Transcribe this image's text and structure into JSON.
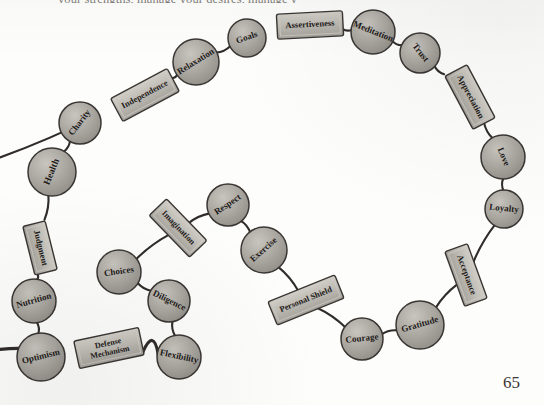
{
  "page": {
    "header_text_sliver": "your strengths, manage your desires, manage y",
    "page_number": "65",
    "background_color": "#fdfdfc",
    "ink_color": "#2f2c29",
    "bead_fill_color": "#a9a6a0",
    "plate_fill_color": "#bfbcb5"
  },
  "diagram": {
    "type": "chain-necklace-concept-map",
    "title": "",
    "nodes": [
      {
        "id": "health",
        "label": "Health",
        "shape": "circle",
        "cx": 52,
        "cy": 172,
        "r": 24,
        "rot": -68,
        "font": 9.5
      },
      {
        "id": "charity",
        "label": "Charity",
        "shape": "circle",
        "cx": 80,
        "cy": 123,
        "r": 21,
        "rot": -52,
        "font": 9.0
      },
      {
        "id": "independence",
        "label": "Independence",
        "shape": "rect",
        "cx": 145,
        "cy": 95,
        "w": 64,
        "h": 26,
        "rot": -28,
        "font": 8.6
      },
      {
        "id": "relaxation",
        "label": "Relaxation",
        "shape": "circle",
        "cx": 196,
        "cy": 62,
        "r": 23,
        "rot": -32,
        "font": 9.0
      },
      {
        "id": "goals",
        "label": "Goals",
        "shape": "circle",
        "cx": 247,
        "cy": 38,
        "r": 19,
        "rot": -20,
        "font": 9.0
      },
      {
        "id": "assertiveness",
        "label": "Assertiveness",
        "shape": "rect",
        "cx": 310,
        "cy": 25,
        "w": 66,
        "h": 25,
        "rot": -3,
        "font": 8.6
      },
      {
        "id": "meditation",
        "label": "Meditation",
        "shape": "circle",
        "cx": 373,
        "cy": 32,
        "r": 22,
        "rot": 22,
        "font": 9.0
      },
      {
        "id": "trust",
        "label": "Trust",
        "shape": "circle",
        "cx": 420,
        "cy": 53,
        "r": 20,
        "rot": 52,
        "font": 9.0
      },
      {
        "id": "appreciation",
        "label": "Appreciation",
        "shape": "rect",
        "cx": 470,
        "cy": 97,
        "w": 60,
        "h": 25,
        "rot": 62,
        "font": 8.6
      },
      {
        "id": "love",
        "label": "Love",
        "shape": "circle",
        "cx": 503,
        "cy": 157,
        "r": 22,
        "rot": 68,
        "font": 9.0
      },
      {
        "id": "loyalty",
        "label": "Loyalty",
        "shape": "circle",
        "cx": 504,
        "cy": 209,
        "r": 19,
        "rot": 6,
        "font": 9.0
      },
      {
        "id": "acceptance",
        "label": "Acceptance",
        "shape": "rect",
        "cx": 466,
        "cy": 275,
        "w": 58,
        "h": 24,
        "rot": 70,
        "font": 8.6
      },
      {
        "id": "gratitude",
        "label": "Gratitude",
        "shape": "circle",
        "cx": 420,
        "cy": 325,
        "r": 24,
        "rot": -16,
        "font": 9.0
      },
      {
        "id": "courage",
        "label": "Courage",
        "shape": "circle",
        "cx": 362,
        "cy": 339,
        "r": 21,
        "rot": -6,
        "font": 9.0
      },
      {
        "id": "personal-shield",
        "label": "Personal Shield",
        "shape": "rect",
        "cx": 306,
        "cy": 300,
        "w": 72,
        "h": 25,
        "rot": -22,
        "font": 8.4
      },
      {
        "id": "exercise",
        "label": "Exercise",
        "shape": "circle",
        "cx": 264,
        "cy": 250,
        "r": 23,
        "rot": -42,
        "font": 9.0
      },
      {
        "id": "respect",
        "label": "Respect",
        "shape": "circle",
        "cx": 228,
        "cy": 205,
        "r": 21,
        "rot": -34,
        "font": 9.0
      },
      {
        "id": "imagination",
        "label": "Imagination",
        "shape": "rect",
        "cx": 178,
        "cy": 228,
        "w": 58,
        "h": 24,
        "rot": 46,
        "font": 8.4
      },
      {
        "id": "choices",
        "label": "Choices",
        "shape": "circle",
        "cx": 119,
        "cy": 272,
        "r": 22,
        "rot": -8,
        "font": 9.0
      },
      {
        "id": "diligence",
        "label": "Diligence",
        "shape": "circle",
        "cx": 169,
        "cy": 301,
        "r": 21,
        "rot": 26,
        "font": 9.0
      },
      {
        "id": "flexibility",
        "label": "Flexibility",
        "shape": "circle",
        "cx": 179,
        "cy": 357,
        "r": 22,
        "rot": 12,
        "font": 9.0
      },
      {
        "id": "defense-mechanism",
        "label": "Defense Mechanism",
        "shape": "rect",
        "cx": 109,
        "cy": 348,
        "w": 66,
        "h": 28,
        "rot": -12,
        "font": 8.0,
        "lines": [
          "Defense",
          "Mechanism"
        ]
      },
      {
        "id": "optimism",
        "label": "Optimism",
        "shape": "circle",
        "cx": 41,
        "cy": 357,
        "r": 24,
        "rot": -14,
        "font": 9.0
      },
      {
        "id": "nutrition",
        "label": "Nutrition",
        "shape": "circle",
        "cx": 34,
        "cy": 301,
        "r": 22,
        "rot": -16,
        "font": 9.0
      },
      {
        "id": "judgment",
        "label": "Judgment",
        "shape": "rect",
        "cx": 40,
        "cy": 248,
        "w": 50,
        "h": 23,
        "rot": 76,
        "font": 8.6
      }
    ],
    "edges": [
      {
        "from": "health",
        "to": "charity"
      },
      {
        "from": "charity",
        "to": "independence"
      },
      {
        "from": "independence",
        "to": "relaxation"
      },
      {
        "from": "relaxation",
        "to": "goals"
      },
      {
        "from": "goals",
        "to": "assertiveness"
      },
      {
        "from": "assertiveness",
        "to": "meditation"
      },
      {
        "from": "meditation",
        "to": "trust"
      },
      {
        "from": "trust",
        "to": "appreciation"
      },
      {
        "from": "appreciation",
        "to": "love"
      },
      {
        "from": "love",
        "to": "loyalty"
      },
      {
        "from": "loyalty",
        "to": "acceptance"
      },
      {
        "from": "acceptance",
        "to": "gratitude"
      },
      {
        "from": "gratitude",
        "to": "courage"
      },
      {
        "from": "courage",
        "to": "personal-shield"
      },
      {
        "from": "personal-shield",
        "to": "exercise"
      },
      {
        "from": "exercise",
        "to": "respect"
      },
      {
        "from": "respect",
        "to": "imagination"
      },
      {
        "from": "imagination",
        "to": "choices"
      },
      {
        "from": "choices",
        "to": "diligence"
      },
      {
        "from": "diligence",
        "to": "flexibility"
      },
      {
        "from": "flexibility",
        "to": "defense-mechanism",
        "curve": "deep"
      },
      {
        "from": "defense-mechanism",
        "to": "optimism",
        "curve": "deep"
      },
      {
        "from": "optimism",
        "to": "nutrition"
      },
      {
        "from": "nutrition",
        "to": "judgment"
      },
      {
        "from": "judgment",
        "to": "health"
      }
    ]
  }
}
